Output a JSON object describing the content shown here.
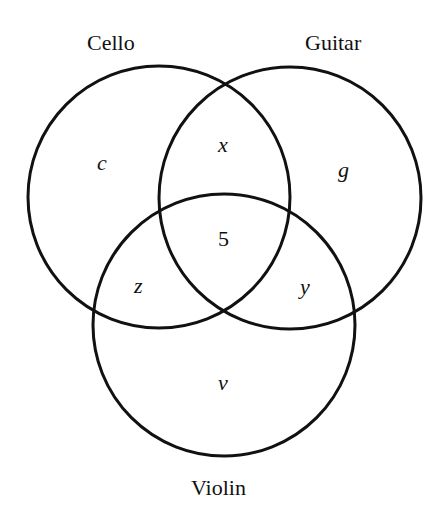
{
  "diagram": {
    "type": "venn",
    "sets": [
      {
        "name": "Cello",
        "label": "Cello"
      },
      {
        "name": "Guitar",
        "label": "Guitar"
      },
      {
        "name": "Violin",
        "label": "Violin"
      }
    ],
    "regions": {
      "cello_only": "c",
      "guitar_only": "g",
      "violin_only": "v",
      "cello_guitar": "x",
      "guitar_violin": "y",
      "cello_violin": "z",
      "all_three": "5"
    }
  }
}
